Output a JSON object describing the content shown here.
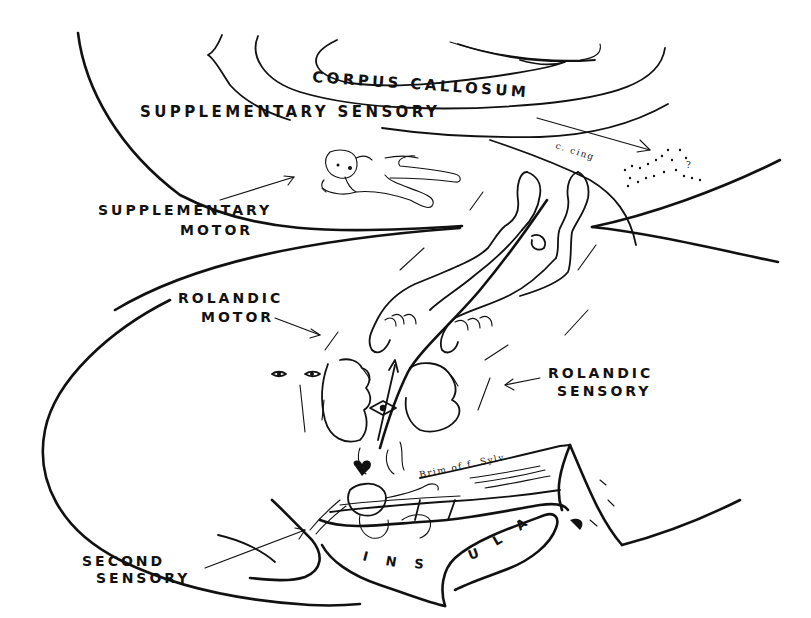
{
  "diagram": {
    "type": "anatomical sketch",
    "labels": {
      "corpus_callosum": "CORPUS CALLOSUM",
      "supplementary_sensory": "SUPPLEMENTARY SENSORY",
      "supplementary_motor_line1": "SUPPLEMENTARY",
      "supplementary_motor_line2": "MOTOR",
      "rolandic_motor_line1": "ROLANDIC",
      "rolandic_motor_line2": "MOTOR",
      "rolandic_sensory_line1": "ROLANDIC",
      "rolandic_sensory_line2": "SENSORY",
      "second_sensory_line1": "SECOND",
      "second_sensory_line2": "SENSORY",
      "insula": [
        "I",
        "N",
        "S",
        "U",
        "L",
        "A"
      ]
    },
    "annotations": {
      "cingulate": "c. cing",
      "sylvian_brim": "Brim of f. Sylv.",
      "question_mark": "?"
    },
    "colors": {
      "ink": "#111111",
      "background": "#ffffff"
    }
  }
}
